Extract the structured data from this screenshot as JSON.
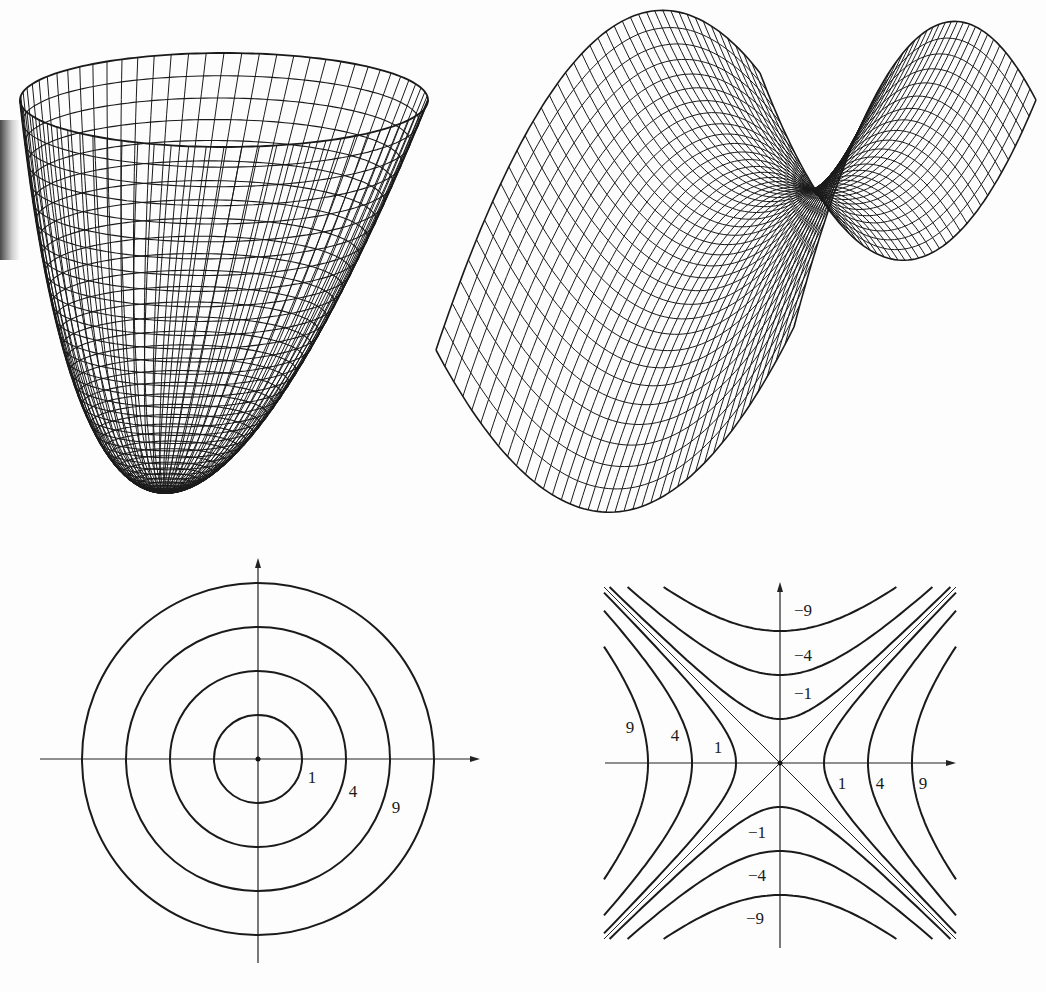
{
  "figure": {
    "panels": [
      "paraboloid-surface",
      "saddle-surface",
      "circle-contours",
      "hyperbola-contours"
    ]
  },
  "chart_data": [
    {
      "type": "surface",
      "name": "paraboloid",
      "equation": "z = x^2 + y^2",
      "render": "wireframe",
      "rings": 36,
      "meridians": 72,
      "projection": {
        "rim_cx": 224,
        "rim_cy": 100,
        "rim_rx": 204,
        "rim_ry": 47,
        "bottom_x": 165,
        "bottom_y": 492
      }
    },
    {
      "type": "surface",
      "name": "saddle",
      "equation": "z = x^2 - y^2",
      "render": "wireframe",
      "grid": 40,
      "projection": {
        "corners_z0": {
          "mm": [
            760,
            73
          ],
          "pm": [
            1036,
            100
          ],
          "pp": [
            794,
            327
          ],
          "mp": [
            436,
            350
          ]
        },
        "z_scale": 173.5
      }
    },
    {
      "type": "contour",
      "name": "circle-contours",
      "equation": "x^2 + y^2 = c",
      "levels": [
        1,
        4,
        9,
        16
      ],
      "labels": [
        {
          "text": "1",
          "x": 312,
          "y": 783
        },
        {
          "text": "4",
          "x": 353,
          "y": 797
        },
        {
          "text": "9",
          "x": 396,
          "y": 813
        }
      ],
      "origin": [
        258,
        759
      ],
      "unit_px": 44,
      "x_axis": [
        40,
        480
      ],
      "y_axis": [
        558,
        963
      ]
    },
    {
      "type": "contour",
      "name": "hyperbola-contours",
      "equation": "x^2 - y^2 = c",
      "levels": [
        -9,
        -4,
        -1,
        0,
        1,
        4,
        9
      ],
      "labels": [
        {
          "text": "−9",
          "x": 803,
          "y": 616
        },
        {
          "text": "−4",
          "x": 803,
          "y": 661
        },
        {
          "text": "−1",
          "x": 803,
          "y": 699
        },
        {
          "text": "9",
          "x": 630,
          "y": 733
        },
        {
          "text": "4",
          "x": 675,
          "y": 741
        },
        {
          "text": "1",
          "x": 718,
          "y": 753
        },
        {
          "text": "1",
          "x": 842,
          "y": 789
        },
        {
          "text": "4",
          "x": 880,
          "y": 789
        },
        {
          "text": "9",
          "x": 923,
          "y": 789
        },
        {
          "text": "−1",
          "x": 757,
          "y": 838
        },
        {
          "text": "−4",
          "x": 757,
          "y": 881
        },
        {
          "text": "−9",
          "x": 755,
          "y": 924
        }
      ],
      "origin": [
        780,
        763
      ],
      "unit_px": 44,
      "domain": [
        -4,
        4
      ],
      "x_axis": [
        605,
        956
      ],
      "y_axis": [
        582,
        948
      ]
    }
  ]
}
